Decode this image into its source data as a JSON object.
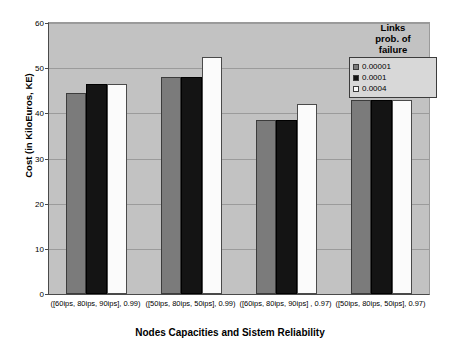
{
  "chart_data": {
    "type": "bar",
    "title": "",
    "xlabel": "Nodes Capacities and Sistem Reliability",
    "ylabel": "Cost (in KiloEuros, KE)",
    "ylim": [
      0,
      60
    ],
    "yticks": [
      0,
      10,
      20,
      30,
      40,
      50,
      60
    ],
    "grid": true,
    "legend_position": "top-right-outside",
    "legend_title": "Links prob. of failure",
    "legend_title_lines": [
      "Links",
      "prob. of",
      "failure"
    ],
    "categories": [
      "([60ips, 80ips, 90ips], 0.99)",
      "([50ips, 80ips, 50ips], 0.99)",
      "([60ips, 80ips, 90ips] , 0.97)",
      "([50ips, 80ips, 50ips], 0.97)"
    ],
    "series": [
      {
        "name": "0.00001",
        "color": "#7b7b7b",
        "values": [
          44.5,
          48.0,
          38.5,
          43.0
        ]
      },
      {
        "name": "0.0001",
        "color": "#141414",
        "values": [
          46.5,
          48.0,
          38.5,
          43.0
        ]
      },
      {
        "name": "0.0004",
        "color": "#fbfbfb",
        "values": [
          46.5,
          52.5,
          42.0,
          43.0
        ]
      }
    ]
  },
  "style": {
    "plot_background": "#c2c2c2",
    "page_background": "#ffffff",
    "axis_color": "#4a4a4a",
    "gridline_color": "#9b9b9b"
  }
}
